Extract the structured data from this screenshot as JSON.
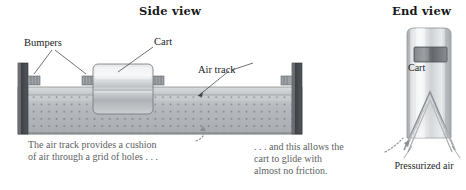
{
  "figure": {
    "background_color": "#ffffff"
  },
  "views": {
    "side": {
      "title": "Side view"
    },
    "end": {
      "title": "End view"
    }
  },
  "labels": {
    "bumpers": "Bumpers",
    "cart": "Cart",
    "air_track": "Air track",
    "cart_end": "Cart",
    "pressurized_air": "Pressurized\nair"
  },
  "captions": {
    "left": "The air track provides a cushion\nof air through a grid of holes . . .",
    "right": ". . . and this allows the\ncart to glide with\nalmost no friction."
  },
  "colors": {
    "ink": "#1c1d1f",
    "caption_text": "#5d5f63",
    "track_body": "#b9bcc0",
    "track_top": "#cfd2d5",
    "track_holes": "#6f7378",
    "bumper_post": "#4a4d51",
    "cart_metal_light": "#e9ebec",
    "cart_metal_mid": "#c3c6c9",
    "cart_metal_dark": "#9ea2a6",
    "leader_line": "#4b4e52",
    "air_jet": "#d7d9db"
  }
}
